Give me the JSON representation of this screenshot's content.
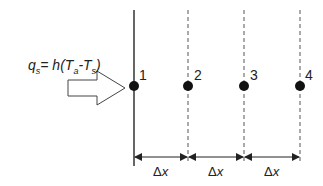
{
  "diagram": {
    "equation": {
      "q": "q",
      "q_sub": "s",
      "rhs_prefix": "= h(T",
      "ta_sub": "a",
      "minus": "-T",
      "ts_sub": "s",
      "close": ")"
    },
    "nodes": [
      {
        "label": "1",
        "x": 134
      },
      {
        "label": "2",
        "x": 188
      },
      {
        "label": "3",
        "x": 244
      },
      {
        "label": "4",
        "x": 300
      }
    ],
    "spacing_labels": [
      {
        "delta": "Δ",
        "var": "x"
      },
      {
        "delta": "Δ",
        "var": "x"
      },
      {
        "delta": "Δ",
        "var": "x"
      }
    ],
    "colors": {
      "line": "#333333",
      "dot": "#111111",
      "dashed": "#555555"
    }
  }
}
